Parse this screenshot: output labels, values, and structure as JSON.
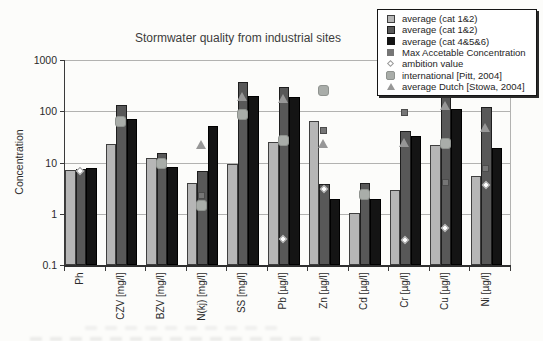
{
  "title": "Stormwater quality from industrial sites",
  "ylabel": "Concentration",
  "colors": {
    "bar_light": "#b6b6b6",
    "bar_dark": "#585858",
    "bar_black": "#141414",
    "mac_square": "#767676",
    "pitt_marker": "#a9ada9",
    "dutch_triangle": "#979797",
    "gridline": "#b2b2b0",
    "axis": "#2f2f2f",
    "background": "#fcfcfa"
  },
  "chart_data": {
    "type": "bar",
    "y_scale": "log",
    "ylim": [
      0.1,
      1000
    ],
    "ytick_labels": [
      "1000",
      "100",
      "10",
      "1",
      "0.1"
    ],
    "ytick_values": [
      1000,
      100,
      10,
      1,
      0.1
    ],
    "grid": "horizontal",
    "legend_position": "top-right",
    "xlabel": "",
    "categories": [
      "Ph",
      "CZV [mg/l]",
      "BZV [mg/l]",
      "N(kj) [mg/l]",
      "SS [mg/l]",
      "Pb [µg/l]",
      "Zn [µg/l]",
      "Cd [µg/l]",
      "Cr [µg/l]",
      "Cu [µg/l]",
      "Ni [µg/l]"
    ],
    "series": [
      {
        "name": "average (cat 1&2)",
        "render": "bar",
        "style": "light-gray",
        "values": [
          7.3,
          23,
          12,
          3.9,
          9.2,
          25,
          65,
          1.05,
          2.9,
          22,
          5.5
        ]
      },
      {
        "name": "average (cat 1&2)",
        "render": "bar",
        "style": "dark-gray",
        "values": [
          7.5,
          130,
          15,
          6.8,
          370,
          300,
          3.8,
          3.9,
          42,
          230,
          120
        ]
      },
      {
        "name": "average (cat 4&5&6)",
        "render": "bar",
        "style": "black",
        "values": [
          7.8,
          70,
          8,
          52,
          200,
          190,
          1.9,
          1.9,
          33,
          110,
          19
        ]
      },
      {
        "name": "Max Accetable Concentration",
        "render": "point",
        "style": "gray-square",
        "values": [
          null,
          null,
          null,
          2.3,
          null,
          null,
          42,
          null,
          95,
          4,
          7.5
        ]
      },
      {
        "name": "ambition value",
        "render": "point",
        "style": "white-diamond",
        "values": [
          6.9,
          null,
          null,
          null,
          null,
          0.32,
          3.1,
          null,
          0.31,
          0.53,
          3.6
        ]
      },
      {
        "name": "international [Pitt, 2004]",
        "render": "point",
        "style": "light-rounded-square",
        "values": [
          null,
          62,
          9.5,
          1.45,
          85,
          27,
          250,
          2.4,
          null,
          24,
          null
        ]
      },
      {
        "name": "average Dutch [Stowa, 2004]",
        "render": "point",
        "style": "gray-triangle",
        "values": [
          null,
          null,
          null,
          22,
          195,
          180,
          23,
          null,
          25,
          130,
          48
        ]
      }
    ]
  }
}
